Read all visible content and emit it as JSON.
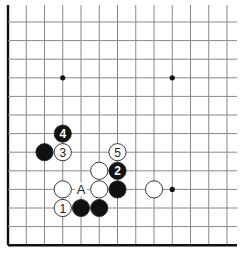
{
  "board": {
    "title": "Go board diagram (lower-left corner)",
    "origin_x": 8,
    "origin_y": 22,
    "spacing_x": 18.25,
    "spacing_y": 18.6,
    "columns": 13,
    "rows": 13,
    "top_extend_y": 5,
    "right_extend_x": 237,
    "colors": {
      "grid": "#888888",
      "border": "#111111",
      "black_stone": "#111111",
      "white_stone": "#ffffff",
      "stone_outline": "#222222"
    }
  },
  "star_points": [
    {
      "col": 3,
      "row": 3
    },
    {
      "col": 9,
      "row": 3
    },
    {
      "col": 9,
      "row": 9
    }
  ],
  "stones": [
    {
      "color": "black",
      "col": 3,
      "row": 6,
      "label": "4"
    },
    {
      "color": "black",
      "col": 2,
      "row": 7,
      "label": ""
    },
    {
      "color": "white",
      "col": 3,
      "row": 7,
      "label": "3"
    },
    {
      "color": "white",
      "col": 6,
      "row": 7,
      "label": "5"
    },
    {
      "color": "white",
      "col": 5,
      "row": 8,
      "label": ""
    },
    {
      "color": "black",
      "col": 6,
      "row": 8,
      "label": "2"
    },
    {
      "color": "white",
      "col": 3,
      "row": 9,
      "label": ""
    },
    {
      "color": "white",
      "col": 5,
      "row": 9,
      "label": ""
    },
    {
      "color": "black",
      "col": 6,
      "row": 9,
      "label": ""
    },
    {
      "color": "white",
      "col": 8,
      "row": 9,
      "label": ""
    },
    {
      "color": "white",
      "col": 3,
      "row": 10,
      "label": "1"
    },
    {
      "color": "black",
      "col": 4,
      "row": 10,
      "label": ""
    },
    {
      "color": "black",
      "col": 5,
      "row": 10,
      "label": ""
    }
  ],
  "marks": [
    {
      "col": 4,
      "row": 9,
      "text": "A"
    }
  ]
}
